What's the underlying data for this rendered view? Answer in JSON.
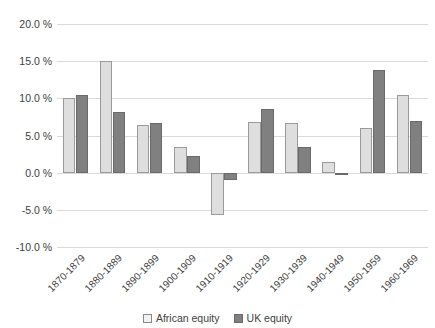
{
  "chart_data": {
    "type": "bar",
    "title": "",
    "subtitle": "",
    "xlabel": "",
    "ylabel": "",
    "ylim": [
      -10.0,
      20.0
    ],
    "ytick_step": 5.0,
    "grid": true,
    "legend_position": "bottom",
    "value_suffix": " %",
    "categories": [
      "1870-1879",
      "1880-1889",
      "1890-1899",
      "1900-1909",
      "1910-1919",
      "1920-1929",
      "1930-1939",
      "1940-1949",
      "1950-1959",
      "1960-1969"
    ],
    "ytick_labels": [
      "20.0 %",
      "15.0 %",
      "10.0 %",
      "5.0 %",
      "0.0 %",
      "-5.0 %",
      "-10.0 %"
    ],
    "ytick_values": [
      20.0,
      15.0,
      10.0,
      5.0,
      0.0,
      -5.0,
      -10.0
    ],
    "series": [
      {
        "name": "African equity",
        "color": "#dedede",
        "values": [
          10.1,
          15.0,
          6.4,
          3.4,
          -5.7,
          6.8,
          6.7,
          1.4,
          6.0,
          10.5
        ]
      },
      {
        "name": "UK equity",
        "color": "#808080",
        "values": [
          10.5,
          8.2,
          6.7,
          2.2,
          -1.0,
          8.6,
          3.5,
          -0.3,
          13.8,
          7.0
        ]
      }
    ]
  },
  "legend": {
    "items": [
      {
        "label": "African equity",
        "swatch": "african"
      },
      {
        "label": "UK equity",
        "swatch": "uk"
      }
    ]
  }
}
